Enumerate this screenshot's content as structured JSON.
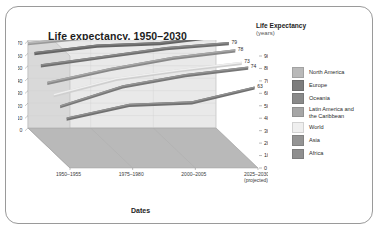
{
  "chart_data": {
    "type": "line",
    "title": "Life expectancy, 1950–2030",
    "xlabel": "Dates",
    "ylabel": "Life Expectancy",
    "y_unit": "(years)",
    "ylim": [
      0,
      90
    ],
    "grid": true,
    "legend_position": "right",
    "style": "3d-ribbon",
    "categories": [
      "1950–1955",
      "1975–1980",
      "2000–2005",
      "2025–2030\n(projected)"
    ],
    "x_tick_labels": [
      "1950–1955",
      "1975–1980",
      "2000–2005",
      "2025–2030"
    ],
    "x_tick_sublabel": "(projected)",
    "y_ticks_left": [
      90,
      80,
      70,
      60,
      50,
      40,
      30,
      20,
      10,
      0
    ],
    "y_ticks_right": [
      90,
      80,
      70,
      60,
      50,
      40,
      30,
      20,
      10,
      0
    ],
    "series": [
      {
        "name": "North America",
        "color": "#b9b9b9",
        "side_color": "#9a9a9a",
        "values": [
          69,
          74,
          78,
          82
        ],
        "end_label": "82"
      },
      {
        "name": "Europe",
        "color": "#7d7d7d",
        "side_color": "#646464",
        "values": [
          66,
          72,
          74,
          80
        ],
        "end_label": "80"
      },
      {
        "name": "Oceania",
        "color": "#8a8a8a",
        "side_color": "#6e6e6e",
        "values": [
          61,
          68,
          75,
          79
        ],
        "end_label": "79"
      },
      {
        "name": "Latin America and\nthe Caribbean",
        "color": "#a6a6a6",
        "side_color": "#888888",
        "values": [
          52,
          63,
          72,
          78
        ],
        "end_label": "78"
      },
      {
        "name": "World",
        "color": "#efefef",
        "side_color": "#cfcfcf",
        "values": [
          47,
          60,
          67,
          73
        ],
        "end_label": "73"
      },
      {
        "name": "Asia",
        "color": "#949494",
        "side_color": "#777777",
        "values": [
          43,
          59,
          68,
          74
        ],
        "end_label": "74"
      },
      {
        "name": "Africa",
        "color": "#8f8f8f",
        "side_color": "#707070",
        "values": [
          38,
          49,
          51,
          63
        ],
        "end_label": "63"
      }
    ]
  },
  "legend": {
    "items": [
      {
        "label": "North America",
        "color": "#b9b9b9"
      },
      {
        "label": "Europe",
        "color": "#7d7d7d"
      },
      {
        "label": "Oceania",
        "color": "#8a8a8a"
      },
      {
        "label": "Latin America and\nthe Caribbean",
        "color": "#a6a6a6"
      },
      {
        "label": "World",
        "color": "#efefef"
      },
      {
        "label": "Asia",
        "color": "#949494"
      },
      {
        "label": "Africa",
        "color": "#8f8f8f"
      }
    ]
  },
  "right_axis": {
    "title": "Life Expectancy",
    "unit": "(years)"
  },
  "colors": {
    "frame_border": "#9a9a9a",
    "background": "#ffffff",
    "wall": "#dcdcdc",
    "floor": "#b5b5b5",
    "plot_face": "#e6e6e6",
    "text": "#1d1d1d"
  }
}
